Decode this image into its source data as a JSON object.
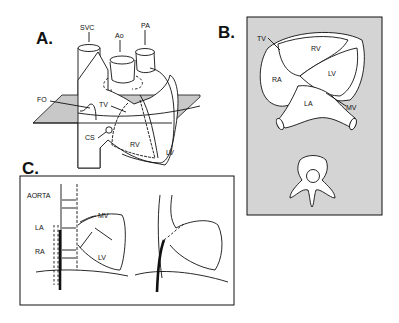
{
  "panels": {
    "a": {
      "letter": "A.",
      "labels": {
        "svc": "SVC",
        "ao": "Ao",
        "pa": "PA",
        "fo": "FO",
        "tv": "TV",
        "cs": "CS",
        "rv": "RV",
        "lv": "LV"
      }
    },
    "b": {
      "letter": "B.",
      "labels": {
        "tv": "TV",
        "rv": "RV",
        "ra": "RA",
        "lv": "LV",
        "la": "LA",
        "mv": "MV"
      }
    },
    "c": {
      "letter": "C.",
      "labels": {
        "aorta": "AORTA",
        "la": "LA",
        "ra": "RA",
        "mv": "MV",
        "lv": "LV"
      }
    }
  },
  "colors": {
    "ink": "#111111",
    "panel_b_bg": "#d4d4d4",
    "plane": "#c8c8c8"
  }
}
